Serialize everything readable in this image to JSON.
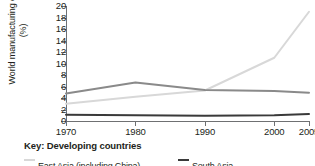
{
  "chart_data": {
    "type": "line",
    "title": "",
    "xlabel": "",
    "ylabel": "World manufacturing output (%)",
    "x": [
      1970,
      1980,
      1990,
      2000,
      2005
    ],
    "xticklabels": [
      "1970",
      "1980",
      "1990",
      "2000",
      "2005"
    ],
    "xlim": [
      1970,
      2005
    ],
    "ylim": [
      0,
      20
    ],
    "yticks": [
      0,
      2,
      4,
      6,
      8,
      10,
      12,
      14,
      16,
      18,
      20
    ],
    "yticklabels": [
      "0",
      "2",
      "4",
      "6",
      "8",
      "10",
      "12",
      "14",
      "16",
      "18",
      "20"
    ],
    "grid": false,
    "legend_position": "bottom",
    "legend_title": "Key: Developing countries",
    "series": [
      {
        "name": "East Asia (including China)",
        "color": "#d8d8d8",
        "values": [
          3.0,
          4.2,
          5.3,
          11.0,
          19.0
        ]
      },
      {
        "name": "Latin America",
        "color": "#8a8a8a",
        "values": [
          4.8,
          6.7,
          5.4,
          5.2,
          4.9
        ]
      },
      {
        "name": "South Asia",
        "color": "#3a3a3a",
        "values": [
          1.1,
          1.0,
          0.9,
          1.0,
          1.2
        ]
      }
    ]
  },
  "axis": {
    "y_title": "World manufacturing output (%)"
  },
  "key": {
    "title": "Key: Developing countries",
    "items": [
      {
        "label": "East Asia (including China)",
        "color": "#d8d8d8"
      },
      {
        "label": "South Asia",
        "color": "#3a3a3a"
      }
    ]
  },
  "colors": {
    "axis": "#6f7072",
    "text": "#231f20",
    "background": "#ffffff"
  }
}
